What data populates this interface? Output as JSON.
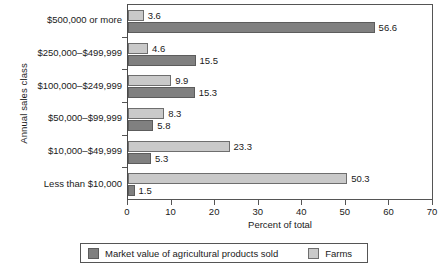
{
  "chart_data": {
    "type": "bar",
    "orientation": "horizontal",
    "title": "",
    "xlabel": "Percent of total",
    "ylabel": "Annual sales class",
    "xlim": [
      0,
      70
    ],
    "xticks": [
      0,
      10,
      20,
      30,
      40,
      50,
      60,
      70
    ],
    "grid": false,
    "legend_position": "bottom",
    "categories": [
      "$500,000 or more",
      "$250,000–$499,999",
      "$100,000–$249,999",
      "$50,000–$99,999",
      "$10,000–$49,999",
      "Less than $10,000"
    ],
    "series": [
      {
        "name": "Farms",
        "color": "#c9c9c9",
        "values": [
          3.6,
          4.6,
          9.9,
          8.3,
          23.3,
          50.3
        ]
      },
      {
        "name": "Market value of agricultural products sold",
        "color": "#808080",
        "values": [
          56.6,
          15.5,
          15.3,
          5.8,
          5.3,
          1.5
        ]
      }
    ],
    "value_labels": {
      "farms": [
        "3.6",
        "4.6",
        "9.9",
        "8.3",
        "23.3",
        "50.3"
      ],
      "market_value": [
        "56.6",
        "15.5",
        "15.3",
        "5.8",
        "5.3",
        "1.5"
      ]
    }
  },
  "legend": {
    "market_label": "Market value of agricultural products sold",
    "farms_label": "Farms"
  },
  "axis": {
    "x_title": "Percent of total",
    "y_title": "Annual sales class",
    "x_tick_labels": [
      "0",
      "10",
      "20",
      "30",
      "40",
      "50",
      "60",
      "70"
    ]
  }
}
